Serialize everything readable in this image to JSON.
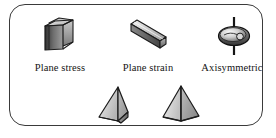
{
  "panel": {
    "name": "element-shape-selector-panel",
    "border_color": "#3a3a3a",
    "background_color": "#ffffff"
  },
  "icon_row": {
    "items": [
      {
        "id": "plane-stress",
        "label": "Plane stress",
        "icon": "3d-slab-icon",
        "description": "thin rectangular plate shown in three-quarter perspective"
      },
      {
        "id": "plane-strain",
        "label": "Plane strain",
        "icon": "3d-prism-bar-icon",
        "description": "long extruded rectangular bar oriented diagonally"
      },
      {
        "id": "axisymmetric",
        "label": "Axisymmetric",
        "icon": "revolved-disc-axis-icon",
        "description": "ellipsoidal disc revolved about a vertical axis line"
      }
    ]
  },
  "solid_row": {
    "items": [
      {
        "id": "tetrahedron",
        "label": "",
        "icon": "tetrahedron-icon",
        "description": "four-faced triangular pyramid, grey shaded"
      },
      {
        "id": "square-pyramid",
        "label": "",
        "icon": "square-pyramid-icon",
        "description": "square-base pyramid, grey shaded"
      }
    ]
  },
  "colors": {
    "outline": "#1c1c1c",
    "face_dark": "#3f3f3f",
    "face_mid": "#8e8e8e",
    "face_light": "#c9c9c9",
    "face_lightest": "#e3e3e3",
    "text": "#141414"
  }
}
